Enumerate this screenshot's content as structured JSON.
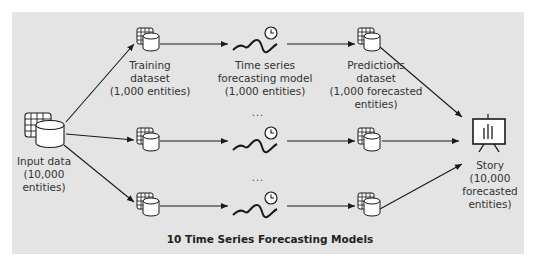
{
  "colors": {
    "panel": "#e4e4e4",
    "stroke": "#1a1a1a",
    "text": "#333333"
  },
  "nodes": {
    "input": {
      "icon": "dataset-icon",
      "label": [
        "Input data",
        "(10,000",
        "entities)"
      ]
    },
    "training": {
      "icon": "dataset-icon",
      "label": [
        "Training",
        "dataset",
        "(1,000 entities)"
      ]
    },
    "model": {
      "icon": "time-series-model-icon",
      "label": [
        "Time series",
        "forecasting model",
        "(1,000 entities)"
      ]
    },
    "predictions": {
      "icon": "dataset-icon",
      "label": [
        "Predictions",
        "dataset",
        "(1,000 forecasted",
        "entities)"
      ]
    },
    "story": {
      "icon": "story-presentation-icon",
      "label": [
        "Story",
        "(10,000",
        "forecasted",
        "entities)"
      ]
    }
  },
  "ellipsis": "...",
  "caption": "10 Time Series Forecasting Models",
  "rows": 3
}
